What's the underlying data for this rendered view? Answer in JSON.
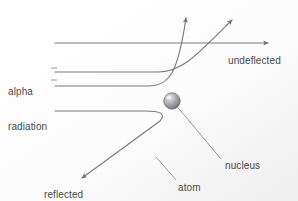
{
  "figure": {
    "width": 298,
    "height": 201,
    "background_color": "#ffffff",
    "stroke_color": "#7a7a80",
    "text_color": "#4a4a4a"
  },
  "labels": {
    "alpha_radiation_line1": "alpha",
    "alpha_radiation_line2": "radiation",
    "undeflected": "undeflected",
    "nucleus": "nucleus",
    "atom": "atom",
    "reflected_back_line1": "reflected",
    "reflected_back_line2": "back"
  },
  "elements": {
    "nucleus_sphere": "nucleus-sphere",
    "beam_undeflected": "alpha-beam-undeflected",
    "beam_deflected_steep": "alpha-beam-deflected-steep",
    "beam_deflected_shallow": "alpha-beam-deflected-shallow",
    "beam_reflected": "alpha-beam-reflected-back",
    "leader_nucleus": "nucleus-leader-line",
    "leader_atom": "atom-leader-line",
    "leader_alpha": "alpha-radiation-leader-line"
  },
  "geometry": {
    "beam_start_x": 55,
    "beam_y_undeflected": 43,
    "beam_y_deflected_steep": 72,
    "beam_y_deflected_shallow": 86,
    "beam_y_reflected": 111,
    "nucleus_center_x": 172,
    "nucleus_center_y": 101,
    "nucleus_radius": 8
  }
}
